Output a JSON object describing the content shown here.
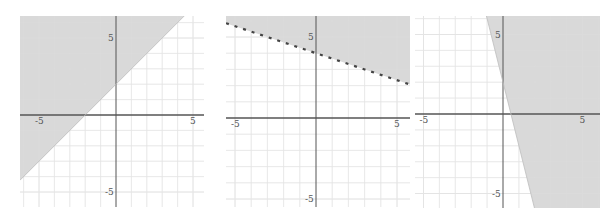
{
  "chart_data": [
    {
      "type": "inequality-graph",
      "title": "",
      "inequality": "y >= x + 2",
      "boundary": {
        "slope": 1,
        "intercept": 2,
        "style": "solid"
      },
      "shade": "above",
      "xlim": [
        -6.3,
        5.8
      ],
      "ylim": [
        -6.0,
        6.5
      ],
      "tick_labels": {
        "x": [
          "-5",
          "5"
        ],
        "y": [
          "5",
          "-5"
        ]
      },
      "grid": true,
      "colors": {
        "shade": "#d6d6d6",
        "axis": "#555555",
        "grid": "#e4e4e4",
        "boundary": "#bdbdbd"
      }
    },
    {
      "type": "inequality-graph",
      "title": "",
      "inequality": "y > -1/3 x + 4",
      "boundary": {
        "slope": -0.3333,
        "intercept": 4,
        "style": "dashed"
      },
      "shade": "above",
      "xlim": [
        -5.6,
        5.8
      ],
      "ylim": [
        -5.5,
        6.3
      ],
      "tick_labels": {
        "x": [
          "-5",
          "5"
        ],
        "y": [
          "5",
          "-5"
        ]
      },
      "grid": true,
      "colors": {
        "shade": "#d6d6d6",
        "axis": "#555555",
        "grid": "#e4e4e4",
        "boundary": "#444444"
      }
    },
    {
      "type": "inequality-graph",
      "title": "",
      "inequality": "y >= -4x + 2",
      "boundary": {
        "slope": -4,
        "intercept": 2,
        "style": "solid"
      },
      "shade": "above-right",
      "xlim": [
        -5.6,
        6.1
      ],
      "ylim": [
        -5.9,
        6.2
      ],
      "tick_labels": {
        "x": [
          "-5",
          "5"
        ],
        "y": [
          "5",
          "-5"
        ]
      },
      "grid": true,
      "colors": {
        "shade": "#d6d6d6",
        "axis": "#555555",
        "grid": "#e4e4e4",
        "boundary": "#bdbdbd"
      }
    }
  ],
  "graphs": [
    {
      "name": "graph-1",
      "left": 20,
      "top": 16,
      "width": 184,
      "height": 191,
      "origin": [
        96,
        99
      ],
      "scale": 15.4
    },
    {
      "name": "graph-2",
      "left": 226,
      "top": 16,
      "width": 184,
      "height": 191,
      "origin": [
        90,
        102
      ],
      "scale": 16.2
    },
    {
      "name": "graph-3",
      "left": 415,
      "top": 16,
      "width": 185,
      "height": 192,
      "origin": [
        88,
        98
      ],
      "scale": 15.9
    }
  ]
}
